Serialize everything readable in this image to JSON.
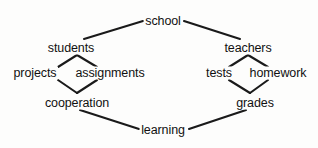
{
  "diagram": {
    "type": "concept-map",
    "background_color": "#fdfdfc",
    "line_color": "#1a1a1a",
    "text_color": "#111111",
    "nodes": [
      {
        "id": "school",
        "label": "school",
        "x": 163,
        "y": 21
      },
      {
        "id": "students",
        "label": "students",
        "x": 71,
        "y": 48
      },
      {
        "id": "teachers",
        "label": "teachers",
        "x": 248,
        "y": 48
      },
      {
        "id": "projects",
        "label": "projects",
        "x": 35,
        "y": 73
      },
      {
        "id": "assignments",
        "label": "assignments",
        "x": 110,
        "y": 73
      },
      {
        "id": "tests",
        "label": "tests",
        "x": 219,
        "y": 73
      },
      {
        "id": "homework",
        "label": "homework",
        "x": 278,
        "y": 73
      },
      {
        "id": "cooperation",
        "label": "cooperation",
        "x": 77,
        "y": 103
      },
      {
        "id": "grades",
        "label": "grades",
        "x": 255,
        "y": 103
      },
      {
        "id": "learning",
        "label": "learning",
        "x": 163,
        "y": 130
      }
    ],
    "edges": [
      {
        "id": "school-students",
        "from": "school",
        "to": "students",
        "x1": 143,
        "y1": 21,
        "x2": 84,
        "y2": 39
      },
      {
        "id": "school-teachers",
        "from": "school",
        "to": "teachers",
        "x1": 184,
        "y1": 21,
        "x2": 240,
        "y2": 39
      },
      {
        "id": "students-projects",
        "from": "students",
        "to": "projects",
        "x1": 77,
        "y1": 55,
        "x2": 58,
        "y2": 67
      },
      {
        "id": "students-assignments",
        "from": "students",
        "to": "assignments",
        "x1": 77,
        "y1": 55,
        "x2": 97,
        "y2": 67
      },
      {
        "id": "projects-cooperation",
        "from": "projects",
        "to": "cooperation",
        "x1": 58,
        "y1": 80,
        "x2": 77,
        "y2": 93
      },
      {
        "id": "assignments-cooperation",
        "from": "assignments",
        "to": "cooperation",
        "x1": 97,
        "y1": 80,
        "x2": 77,
        "y2": 93
      },
      {
        "id": "teachers-tests",
        "from": "teachers",
        "to": "tests",
        "x1": 248,
        "y1": 55,
        "x2": 229,
        "y2": 67
      },
      {
        "id": "teachers-homework",
        "from": "teachers",
        "to": "homework",
        "x1": 248,
        "y1": 55,
        "x2": 268,
        "y2": 67
      },
      {
        "id": "tests-grades",
        "from": "tests",
        "to": "grades",
        "x1": 229,
        "y1": 80,
        "x2": 250,
        "y2": 93
      },
      {
        "id": "homework-grades",
        "from": "homework",
        "to": "grades",
        "x1": 268,
        "y1": 80,
        "x2": 250,
        "y2": 93
      },
      {
        "id": "cooperation-learning",
        "from": "cooperation",
        "to": "learning",
        "x1": 80,
        "y1": 110,
        "x2": 139,
        "y2": 129
      },
      {
        "id": "grades-learning",
        "from": "grades",
        "to": "learning",
        "x1": 246,
        "y1": 110,
        "x2": 189,
        "y2": 129
      }
    ]
  }
}
